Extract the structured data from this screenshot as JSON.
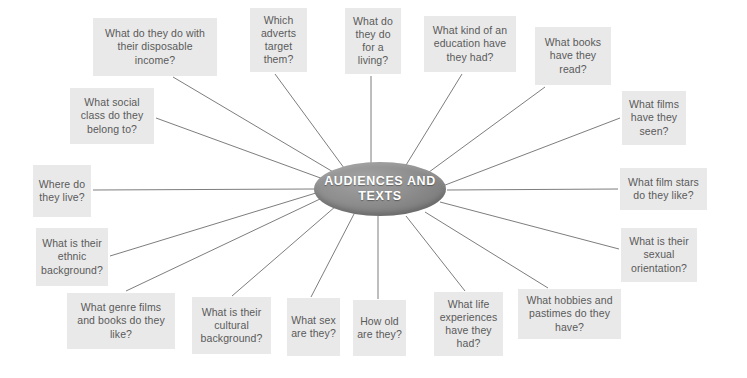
{
  "diagram": {
    "type": "spider-diagram",
    "center": {
      "label_line_1": "AUDIENCES",
      "label_line_2": "AND TEXTS",
      "fill_color": "#8a8a8a",
      "text_color": "#ffffff"
    },
    "style": {
      "box_fill": "#e9e9e9",
      "box_text_color": "#5a5a5a",
      "connector_color": "#6e6e6e",
      "background": "#ffffff"
    },
    "nodes": [
      {
        "id": "disposable-income",
        "text": "What do they do with their disposable income?",
        "x": 93,
        "y": 18,
        "w": 124,
        "h": 58
      },
      {
        "id": "adverts-target",
        "text": "Which adverts target them?",
        "x": 250,
        "y": 8,
        "w": 57,
        "h": 64
      },
      {
        "id": "living",
        "text": "What do they do for a living?",
        "x": 345,
        "y": 8,
        "w": 56,
        "h": 66
      },
      {
        "id": "education",
        "text": "What kind of an education have they had?",
        "x": 424,
        "y": 16,
        "w": 92,
        "h": 56
      },
      {
        "id": "books-read",
        "text": "What books have they read?",
        "x": 535,
        "y": 27,
        "w": 76,
        "h": 58
      },
      {
        "id": "films-seen",
        "text": "What films have they seen?",
        "x": 622,
        "y": 91,
        "w": 64,
        "h": 54
      },
      {
        "id": "film-stars",
        "text": "What film stars do they like?",
        "x": 620,
        "y": 168,
        "w": 87,
        "h": 42
      },
      {
        "id": "sexual-orientation",
        "text": "What is their sexual orientation?",
        "x": 621,
        "y": 228,
        "w": 76,
        "h": 54
      },
      {
        "id": "hobbies-pastimes",
        "text": "What hobbies and pastimes do they have?",
        "x": 518,
        "y": 289,
        "w": 103,
        "h": 50
      },
      {
        "id": "life-experiences",
        "text": "What life experiences have they had?",
        "x": 434,
        "y": 292,
        "w": 69,
        "h": 64
      },
      {
        "id": "how-old",
        "text": "How old are they?",
        "x": 353,
        "y": 300,
        "w": 53,
        "h": 56
      },
      {
        "id": "sex",
        "text": "What sex are they?",
        "x": 287,
        "y": 298,
        "w": 53,
        "h": 58
      },
      {
        "id": "cultural-background",
        "text": "What is their cultural background?",
        "x": 192,
        "y": 297,
        "w": 79,
        "h": 57
      },
      {
        "id": "genre-films-books",
        "text": "What genre films and books do they like?",
        "x": 67,
        "y": 293,
        "w": 108,
        "h": 56
      },
      {
        "id": "ethnic-background",
        "text": "What is their ethnic background?",
        "x": 36,
        "y": 228,
        "w": 72,
        "h": 58
      },
      {
        "id": "where-live",
        "text": "Where do they live?",
        "x": 33,
        "y": 165,
        "w": 58,
        "h": 52
      },
      {
        "id": "social-class",
        "text": "What social class do they belong to?",
        "x": 70,
        "y": 88,
        "w": 84,
        "h": 56
      }
    ],
    "connectors": [
      {
        "from": "disposable-income",
        "x1": 173,
        "y1": 77,
        "x2": 340,
        "y2": 176
      },
      {
        "from": "adverts-target",
        "x1": 275,
        "y1": 74,
        "x2": 347,
        "y2": 172
      },
      {
        "from": "living",
        "x1": 371,
        "y1": 76,
        "x2": 371,
        "y2": 163
      },
      {
        "from": "education",
        "x1": 462,
        "y1": 74,
        "x2": 403,
        "y2": 170
      },
      {
        "from": "books-read",
        "x1": 545,
        "y1": 87,
        "x2": 425,
        "y2": 175
      },
      {
        "from": "films-seen",
        "x1": 620,
        "y1": 118,
        "x2": 440,
        "y2": 187
      },
      {
        "from": "film-stars",
        "x1": 618,
        "y1": 189,
        "x2": 447,
        "y2": 190
      },
      {
        "from": "sexual-orientation",
        "x1": 619,
        "y1": 249,
        "x2": 440,
        "y2": 202
      },
      {
        "from": "hobbies-pastimes",
        "x1": 548,
        "y1": 288,
        "x2": 425,
        "y2": 212
      },
      {
        "from": "life-experiences",
        "x1": 465,
        "y1": 291,
        "x2": 406,
        "y2": 216
      },
      {
        "from": "how-old",
        "x1": 378,
        "y1": 299,
        "x2": 378,
        "y2": 216
      },
      {
        "from": "sex",
        "x1": 311,
        "y1": 297,
        "x2": 354,
        "y2": 214
      },
      {
        "from": "cultural-background",
        "x1": 232,
        "y1": 296,
        "x2": 336,
        "y2": 206
      },
      {
        "from": "genre-films-books",
        "x1": 126,
        "y1": 291,
        "x2": 320,
        "y2": 199
      },
      {
        "from": "ethnic-background",
        "x1": 110,
        "y1": 256,
        "x2": 316,
        "y2": 193
      },
      {
        "from": "where-live",
        "x1": 93,
        "y1": 190,
        "x2": 314,
        "y2": 189
      },
      {
        "from": "social-class",
        "x1": 156,
        "y1": 118,
        "x2": 326,
        "y2": 180
      }
    ]
  }
}
